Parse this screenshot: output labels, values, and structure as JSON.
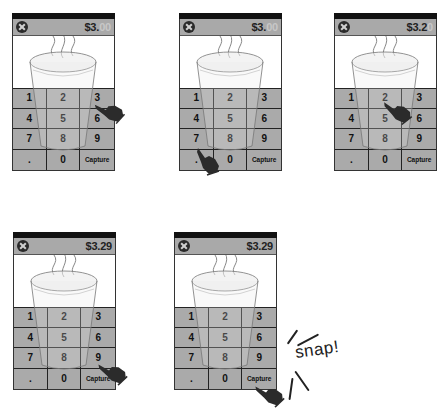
{
  "panels": [
    {
      "id": 1,
      "price_entered": "$3.",
      "price_placeholder": "00",
      "tap_key": "3"
    },
    {
      "id": 2,
      "price_entered": "$3.",
      "price_placeholder": "00",
      "tap_key": "."
    },
    {
      "id": 3,
      "price_entered": "$3.2",
      "price_placeholder": "0",
      "tap_key": "2"
    },
    {
      "id": 4,
      "price_entered": "$3.29",
      "price_placeholder": "",
      "tap_key": "9"
    },
    {
      "id": 5,
      "price_entered": "$3.29",
      "price_placeholder": "",
      "tap_key": "Capture"
    }
  ],
  "keypad": {
    "keys": [
      "1",
      "2",
      "3",
      "4",
      "5",
      "6",
      "7",
      "8",
      "9",
      ".",
      "0",
      "Capture"
    ]
  },
  "icons": {
    "close": "close-circle-icon",
    "cursor": "pointing-hand-icon",
    "product": "coffee-cup-icon"
  },
  "annotation": {
    "snap_label": "snap!"
  },
  "colors": {
    "status_bar": "#111111",
    "header_bg": "#a9a9a9",
    "keypad_bg": "#a9a9a9",
    "ghost_digits": "#c7c7c7",
    "border": "#222222"
  }
}
